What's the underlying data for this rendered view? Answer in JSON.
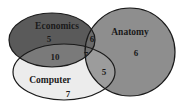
{
  "diagram": {
    "type": "venn-3",
    "sets": [
      {
        "id": "economics",
        "label": "Economics",
        "color": "#5a5a5a"
      },
      {
        "id": "anatomy",
        "label": "Anatomy",
        "color": "#8e8e8e"
      },
      {
        "id": "computer",
        "label": "Computer",
        "color": "#ececec"
      }
    ],
    "regions": {
      "economics_only": "5",
      "anatomy_only": "6",
      "computer_only": "7",
      "economics_anatomy": "6",
      "economics_computer": "10",
      "anatomy_computer": "5",
      "all_three": "7"
    },
    "colors": {
      "economics_computer": "#7a7a7a",
      "anatomy_computer": "#9c9c9c",
      "economics_anatomy": "#6a6a6a",
      "all_three": "#727272",
      "outline": "#1a1a1a"
    }
  }
}
